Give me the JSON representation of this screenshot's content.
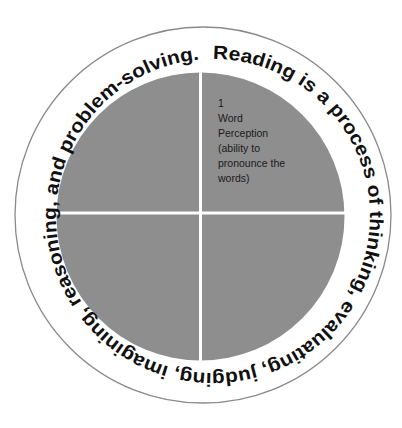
{
  "diagram": {
    "type": "circular-quadrant-diagram",
    "ring_text": "Reading is a process of thinking, evaluating, judging, imagining, reasoning, and problem-solving.",
    "colors": {
      "quadrant_fill": "#8e8e8e",
      "divider": "#ffffff",
      "outer_ring_stroke": "#8a8a8a",
      "text": "#111111",
      "background": "#ffffff"
    },
    "quadrants": [
      {
        "position": "top-right",
        "number": "1",
        "lines": [
          "Word",
          "Perception",
          "(ability to",
          "pronounce the",
          "words)"
        ]
      },
      {
        "position": "top-left",
        "number": "",
        "lines": []
      },
      {
        "position": "bottom-left",
        "number": "",
        "lines": []
      },
      {
        "position": "bottom-right",
        "number": "",
        "lines": []
      }
    ]
  }
}
